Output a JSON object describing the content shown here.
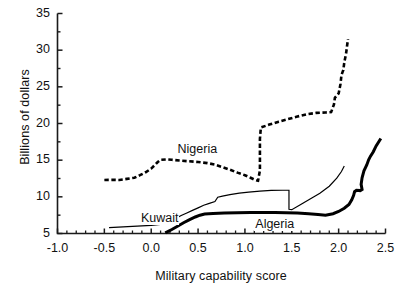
{
  "chart_data": {
    "type": "line",
    "title": "",
    "xlabel": "Military capability score",
    "ylabel": "Billions of dollars",
    "xlim": [
      -1.0,
      2.5
    ],
    "ylim": [
      5,
      35
    ],
    "xticks": [
      "-1.0",
      "-0.5",
      "0.0",
      "0.5",
      "1.0",
      "1.5",
      "2.0",
      "2.5"
    ],
    "xtick_values": [
      -1.0,
      -0.5,
      0.0,
      0.5,
      1.0,
      1.5,
      2.0,
      2.5
    ],
    "yticks": [
      "5",
      "10",
      "15",
      "20",
      "25",
      "30",
      "35"
    ],
    "ytick_values": [
      5,
      10,
      15,
      20,
      25,
      30,
      35
    ],
    "minor_ticks": true,
    "grid": false,
    "legend": "inline-annotations",
    "series": [
      {
        "name": "Nigeria",
        "style": "dashed",
        "color": "#000000",
        "linewidth": 2.6,
        "label_position": {
          "x": 0.27,
          "y": 16.4
        },
        "points": [
          [
            -0.5,
            12.3
          ],
          [
            -0.42,
            12.32
          ],
          [
            -0.34,
            12.3
          ],
          [
            -0.26,
            12.45
          ],
          [
            -0.18,
            12.6
          ],
          [
            -0.12,
            12.95
          ],
          [
            -0.06,
            13.35
          ],
          [
            0.0,
            13.85
          ],
          [
            0.04,
            14.35
          ],
          [
            0.07,
            14.75
          ],
          [
            0.1,
            15.05
          ],
          [
            0.16,
            15.1
          ],
          [
            0.22,
            15.05
          ],
          [
            0.3,
            14.95
          ],
          [
            0.4,
            14.85
          ],
          [
            0.5,
            14.75
          ],
          [
            0.6,
            14.6
          ],
          [
            0.68,
            14.4
          ],
          [
            0.76,
            14.05
          ],
          [
            0.84,
            13.7
          ],
          [
            0.92,
            13.3
          ],
          [
            1.0,
            12.95
          ],
          [
            1.06,
            12.6
          ],
          [
            1.1,
            12.35
          ],
          [
            1.14,
            12.2
          ],
          [
            1.16,
            13.6
          ],
          [
            1.16,
            15.8
          ],
          [
            1.16,
            17.9
          ],
          [
            1.17,
            19.45
          ],
          [
            1.26,
            19.85
          ],
          [
            1.36,
            20.25
          ],
          [
            1.46,
            20.6
          ],
          [
            1.56,
            20.95
          ],
          [
            1.66,
            21.25
          ],
          [
            1.76,
            21.45
          ],
          [
            1.86,
            21.5
          ],
          [
            1.92,
            21.55
          ],
          [
            1.95,
            22.6
          ],
          [
            1.96,
            23.5
          ],
          [
            2.0,
            24.1
          ],
          [
            2.02,
            25.4
          ],
          [
            2.03,
            26.6
          ],
          [
            2.05,
            27.3
          ],
          [
            2.06,
            28.3
          ],
          [
            2.08,
            29.6
          ],
          [
            2.09,
            30.6
          ],
          [
            2.1,
            31.5
          ]
        ]
      },
      {
        "name": "Kuwait",
        "style": "solid-thin",
        "color": "#000000",
        "linewidth": 1.2,
        "label_position": {
          "x": -0.12,
          "y": 6.95
        },
        "points": [
          [
            -0.45,
            5.8
          ],
          [
            -0.3,
            5.9
          ],
          [
            -0.15,
            6.0
          ],
          [
            0.0,
            6.12
          ],
          [
            0.1,
            6.25
          ],
          [
            0.16,
            6.35
          ],
          [
            0.2,
            6.65
          ],
          [
            0.26,
            7.05
          ],
          [
            0.32,
            7.45
          ],
          [
            0.38,
            7.8
          ],
          [
            0.44,
            8.15
          ],
          [
            0.5,
            8.5
          ],
          [
            0.56,
            8.85
          ],
          [
            0.62,
            9.1
          ],
          [
            0.68,
            9.35
          ],
          [
            0.71,
            9.95
          ],
          [
            0.76,
            10.1
          ],
          [
            0.84,
            10.3
          ],
          [
            0.94,
            10.5
          ],
          [
            1.04,
            10.65
          ],
          [
            1.16,
            10.78
          ],
          [
            1.28,
            10.88
          ],
          [
            1.4,
            10.9
          ],
          [
            1.47,
            10.9
          ],
          [
            1.47,
            9.6
          ],
          [
            1.47,
            8.3
          ],
          [
            1.5,
            8.25
          ],
          [
            1.6,
            9.0
          ],
          [
            1.7,
            9.75
          ],
          [
            1.8,
            10.5
          ],
          [
            1.9,
            11.45
          ],
          [
            1.98,
            12.55
          ],
          [
            2.03,
            13.45
          ],
          [
            2.06,
            14.2
          ]
        ]
      },
      {
        "name": "Algeria",
        "style": "solid-thick",
        "color": "#000000",
        "linewidth": 3.0,
        "label_position": {
          "x": 1.1,
          "y": 6.15
        },
        "points": [
          [
            0.15,
            5.08
          ],
          [
            0.22,
            5.55
          ],
          [
            0.29,
            6.05
          ],
          [
            0.35,
            6.5
          ],
          [
            0.41,
            6.9
          ],
          [
            0.47,
            7.25
          ],
          [
            0.52,
            7.5
          ],
          [
            0.57,
            7.65
          ],
          [
            0.66,
            7.72
          ],
          [
            0.78,
            7.78
          ],
          [
            0.92,
            7.82
          ],
          [
            1.06,
            7.86
          ],
          [
            1.2,
            7.88
          ],
          [
            1.32,
            7.88
          ],
          [
            1.44,
            7.84
          ],
          [
            1.56,
            7.78
          ],
          [
            1.68,
            7.68
          ],
          [
            1.78,
            7.58
          ],
          [
            1.86,
            7.5
          ],
          [
            1.94,
            7.7
          ],
          [
            2.0,
            8.0
          ],
          [
            2.06,
            8.45
          ],
          [
            2.11,
            8.95
          ],
          [
            2.14,
            9.6
          ],
          [
            2.16,
            10.2
          ],
          [
            2.17,
            10.7
          ],
          [
            2.19,
            10.9
          ],
          [
            2.23,
            10.85
          ],
          [
            2.25,
            11.0
          ],
          [
            2.24,
            11.7
          ],
          [
            2.25,
            12.6
          ],
          [
            2.27,
            13.55
          ],
          [
            2.3,
            14.35
          ],
          [
            2.32,
            15.05
          ],
          [
            2.34,
            15.55
          ],
          [
            2.37,
            16.15
          ],
          [
            2.4,
            16.95
          ],
          [
            2.43,
            17.55
          ],
          [
            2.45,
            17.95
          ]
        ]
      }
    ]
  },
  "footer": {
    "fragment": ""
  }
}
